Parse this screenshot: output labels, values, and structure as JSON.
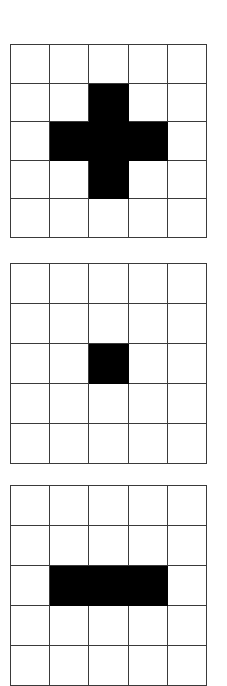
{
  "figure": {
    "title": "",
    "background_color": "#ffffff",
    "grid_line_color": "#3a3a3a",
    "fill_color": "#000000",
    "panel_count": 3
  },
  "chart_data": {
    "type": "heatmap",
    "title": "",
    "xlabel": "",
    "ylabel": "",
    "grid": true,
    "legend": "none",
    "rows": 5,
    "cols": 5,
    "value_legend": {
      "0": "empty (white)",
      "1": "filled (black)"
    },
    "panels": [
      {
        "name": "cross",
        "label": "",
        "values": [
          [
            0,
            0,
            0,
            0,
            0
          ],
          [
            0,
            0,
            1,
            0,
            0
          ],
          [
            0,
            1,
            1,
            1,
            0
          ],
          [
            0,
            0,
            1,
            0,
            0
          ],
          [
            0,
            0,
            0,
            0,
            0
          ]
        ],
        "filled_count": 5
      },
      {
        "name": "single-center",
        "label": "",
        "values": [
          [
            0,
            0,
            0,
            0,
            0
          ],
          [
            0,
            0,
            0,
            0,
            0
          ],
          [
            0,
            0,
            1,
            0,
            0
          ],
          [
            0,
            0,
            0,
            0,
            0
          ],
          [
            0,
            0,
            0,
            0,
            0
          ]
        ],
        "filled_count": 1
      },
      {
        "name": "horizontal-bar",
        "label": "",
        "values": [
          [
            0,
            0,
            0,
            0,
            0
          ],
          [
            0,
            0,
            0,
            0,
            0
          ],
          [
            0,
            1,
            1,
            1,
            0
          ],
          [
            0,
            0,
            0,
            0,
            0
          ],
          [
            0,
            0,
            0,
            0,
            0
          ]
        ],
        "filled_count": 3
      }
    ]
  }
}
